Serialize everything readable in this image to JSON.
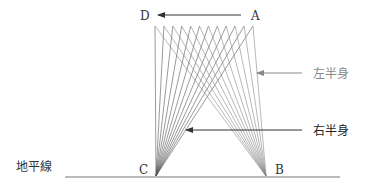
{
  "diagram": {
    "points": {
      "A": "A",
      "B": "B",
      "C": "C",
      "D": "D"
    },
    "labels": {
      "left_half": "左半身",
      "right_half": "右半身",
      "horizon": "地平線"
    },
    "fan_line_count": 12,
    "colors": {
      "line": "#555555",
      "left_half_text": "#888888",
      "right_half_text": "#222222",
      "ground": "#777777"
    }
  }
}
